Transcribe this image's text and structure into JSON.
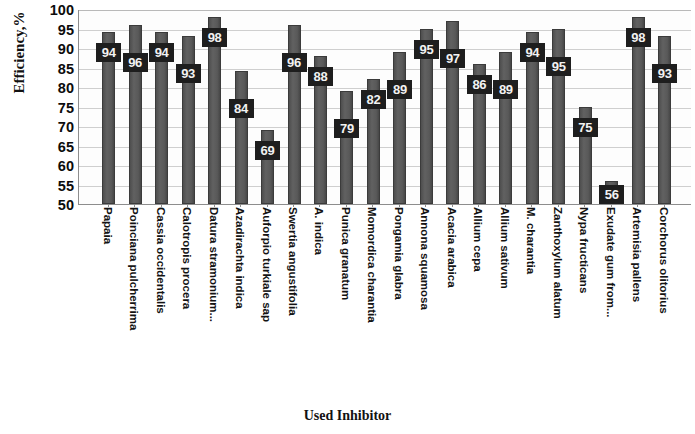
{
  "chart_data": {
    "type": "bar",
    "title": "",
    "xlabel": "Used Inhibitor",
    "ylabel": "Efficiency,%",
    "ylim": [
      50,
      100
    ],
    "ytick_step": 5,
    "yticks": [
      100,
      95,
      90,
      85,
      80,
      75,
      70,
      65,
      60,
      55,
      50
    ],
    "grid": true,
    "legend": "none",
    "bar_color": "#565656",
    "label_box_color": "#1e1e1e",
    "label_text_color": "#f2f2f2",
    "categories": [
      "Papaia",
      "Poinciana pulcherrima",
      "Cassia occidentalis",
      "Calotropis procera",
      "Datura stramonium...",
      "Azadirachta indica",
      "Auforpio turkiale sap",
      "Swertia angustifolia",
      "A. indica",
      "Punica granatum",
      "Momordica charantia",
      "Pongamia glabra",
      "Annona squamosa",
      "Acacia arabica",
      "Allium cepa",
      "Allium sativum",
      "M. charantia",
      "Zanthoxylum alatum",
      "Nypa fructicans",
      "Exudate gum from...",
      "Artemisia pallens",
      "Corchorus olitorius"
    ],
    "values": [
      94,
      96,
      94,
      93,
      98,
      84,
      69,
      96,
      88,
      79,
      82,
      89,
      95,
      97,
      86,
      89,
      94,
      95,
      75,
      56,
      98,
      93
    ]
  }
}
